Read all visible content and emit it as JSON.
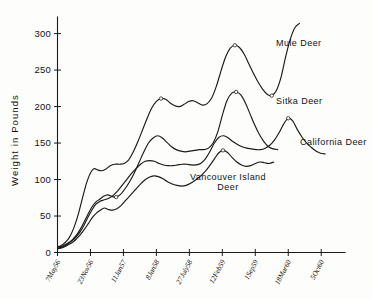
{
  "chart_data": {
    "type": "line",
    "title": "",
    "xlabel": "",
    "ylabel": "Weight in Pounds",
    "ylim": [
      0,
      320
    ],
    "yticks": [
      0,
      50,
      100,
      150,
      200,
      250,
      300
    ],
    "ytick_labels": [
      "0",
      "50",
      "100",
      "150",
      "200",
      "250",
      "300"
    ],
    "grid": false,
    "legend_position": "inline-annotations",
    "x_tick_labels": [
      "7May56",
      "23Nov56",
      "11Jan57",
      "8Jan58",
      "27July58",
      "12Feb59",
      "1Sep59",
      "18Mar60",
      "5Oct60"
    ],
    "x_tick_index": [
      0,
      1,
      2,
      3,
      4,
      5,
      6,
      7,
      8
    ],
    "x_units": "date",
    "series": [
      {
        "name": "Mule Deer",
        "label_text": "Mule Deer",
        "x": [
          0.0,
          0.08,
          0.16,
          0.24,
          0.32,
          0.4,
          0.48,
          0.56,
          0.64,
          0.72,
          0.8,
          0.88,
          0.96,
          1.04,
          1.12,
          1.22,
          1.34,
          1.46,
          1.6,
          1.74,
          1.88,
          2.02,
          2.16,
          2.3,
          2.44,
          2.58,
          2.72,
          2.86,
          3.0,
          3.14,
          3.28,
          3.42,
          3.56,
          3.7,
          3.84,
          3.98,
          4.12,
          4.26,
          4.4,
          4.54,
          4.68,
          4.82,
          4.96,
          5.1,
          5.24,
          5.38,
          5.52,
          5.66,
          5.8,
          5.94,
          6.08,
          6.22,
          6.36,
          6.5,
          6.64,
          6.78,
          6.92,
          7.06,
          7.2,
          7.34
        ],
        "values": [
          8,
          9,
          11,
          14,
          18,
          24,
          32,
          42,
          54,
          68,
          82,
          95,
          105,
          112,
          115,
          113,
          112,
          114,
          119,
          121,
          121,
          122,
          127,
          138,
          152,
          168,
          184,
          198,
          207,
          211,
          210,
          205,
          201,
          200,
          203,
          207,
          208,
          205,
          202,
          204,
          212,
          228,
          249,
          268,
          280,
          284,
          281,
          272,
          259,
          246,
          234,
          224,
          217,
          215,
          222,
          240,
          268,
          292,
          308,
          314
        ]
      },
      {
        "name": "Sitka Deer",
        "label_text": "Sitka Deer",
        "x": [
          0.0,
          0.1,
          0.2,
          0.32,
          0.44,
          0.56,
          0.68,
          0.8,
          0.92,
          1.04,
          1.16,
          1.28,
          1.4,
          1.52,
          1.64,
          1.78,
          1.92,
          2.06,
          2.2,
          2.34,
          2.48,
          2.62,
          2.76,
          2.9,
          3.04,
          3.18,
          3.32,
          3.46,
          3.6,
          3.74,
          3.88,
          4.02,
          4.16,
          4.3,
          4.44,
          4.58,
          4.72,
          4.86,
          5.0,
          5.14,
          5.28,
          5.42,
          5.56,
          5.7,
          5.84,
          5.98,
          6.12,
          6.26,
          6.4,
          6.54,
          6.68
        ],
        "values": [
          7,
          8,
          10,
          13,
          17,
          23,
          31,
          41,
          52,
          62,
          69,
          73,
          77,
          79,
          77,
          76,
          80,
          88,
          98,
          110,
          124,
          138,
          150,
          157,
          160,
          157,
          151,
          145,
          141,
          139,
          138,
          139,
          140,
          141,
          141,
          143,
          150,
          165,
          188,
          208,
          218,
          220,
          216,
          205,
          190,
          175,
          162,
          152,
          145,
          142,
          141
        ]
      },
      {
        "name": "California Deer",
        "label_text": "California Deer",
        "x": [
          0.0,
          0.1,
          0.2,
          0.32,
          0.44,
          0.56,
          0.68,
          0.8,
          0.92,
          1.04,
          1.16,
          1.28,
          1.4,
          1.54,
          1.68,
          1.82,
          1.96,
          2.1,
          2.24,
          2.38,
          2.52,
          2.66,
          2.8,
          2.94,
          3.08,
          3.22,
          3.36,
          3.5,
          3.64,
          3.78,
          3.92,
          4.06,
          4.2,
          4.34,
          4.48,
          4.62,
          4.76,
          4.9,
          5.04,
          5.18,
          5.32,
          5.46,
          5.6,
          5.74,
          5.88,
          6.02,
          6.16,
          6.3,
          6.44,
          6.58,
          6.72,
          6.86,
          7.0,
          7.14,
          7.28,
          7.42,
          7.56,
          7.7,
          7.84,
          7.98,
          8.12
        ],
        "values": [
          6,
          7,
          9,
          12,
          16,
          21,
          28,
          37,
          48,
          58,
          66,
          70,
          72,
          74,
          78,
          84,
          92,
          100,
          108,
          115,
          121,
          125,
          126,
          125,
          122,
          120,
          119,
          119,
          120,
          121,
          121,
          120,
          120,
          122,
          128,
          138,
          150,
          158,
          160,
          157,
          152,
          148,
          145,
          143,
          142,
          141,
          141,
          143,
          147,
          154,
          164,
          176,
          184,
          180,
          168,
          158,
          150,
          144,
          139,
          136,
          135
        ]
      },
      {
        "name": "Vancouver Island Deer",
        "label_text_line1": "Vancouver  Island",
        "label_text_line2": "Deer",
        "x": [
          0.0,
          0.1,
          0.22,
          0.34,
          0.46,
          0.58,
          0.7,
          0.82,
          0.94,
          1.06,
          1.18,
          1.3,
          1.42,
          1.54,
          1.66,
          1.8,
          1.94,
          2.08,
          2.22,
          2.36,
          2.5,
          2.64,
          2.78,
          2.92,
          3.06,
          3.2,
          3.34,
          3.48,
          3.62,
          3.76,
          3.9,
          4.04,
          4.18,
          4.32,
          4.46,
          4.6,
          4.74,
          4.88,
          5.02,
          5.16,
          5.3,
          5.44,
          5.58,
          5.72,
          5.86,
          6.0,
          6.14,
          6.28,
          6.42,
          6.56
        ],
        "values": [
          5,
          6,
          8,
          11,
          14,
          19,
          25,
          32,
          40,
          48,
          54,
          58,
          61,
          59,
          58,
          60,
          65,
          72,
          79,
          86,
          93,
          99,
          103,
          105,
          104,
          101,
          97,
          94,
          92,
          91,
          92,
          95,
          99,
          104,
          110,
          118,
          127,
          136,
          140,
          137,
          130,
          124,
          120,
          118,
          119,
          122,
          124,
          123,
          122,
          124
        ]
      }
    ],
    "annotations": [
      {
        "text": "Mule Deer",
        "series": "Mule Deer"
      },
      {
        "text": "Sitka Deer",
        "series": "Sitka Deer"
      },
      {
        "text": "California Deer",
        "series": "California Deer"
      },
      {
        "text": "Vancouver Island Deer",
        "series": "Vancouver Island Deer"
      }
    ],
    "style": {
      "line_color": "#1a1a1a",
      "background": "#fdfdfb",
      "marker": "open-circle"
    }
  }
}
